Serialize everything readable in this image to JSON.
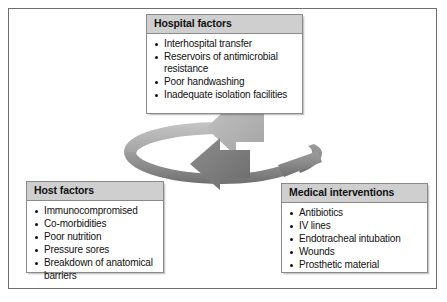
{
  "figure": {
    "frame_color": "#6f6f6f",
    "background": "#ffffff"
  },
  "cycle": {
    "name": "cycle-ring",
    "description": "Circular two-headed arrow linking the three factor groups",
    "ring_color_light": "#b9b9b9",
    "ring_color_dark": "#7d7d7d",
    "arrow_up_color": "#b0b0b0",
    "arrow_down_color": "#7a7a7a",
    "arrows": [
      {
        "name": "arrow-to-hospital",
        "direction": "up-left",
        "target": "Hospital factors"
      },
      {
        "name": "arrow-to-medical",
        "direction": "down-right",
        "target": "Medical interventions"
      }
    ]
  },
  "boxes": [
    {
      "id": "hospital",
      "title": "Hospital factors",
      "items": [
        "Interhospital transfer",
        "Reservoirs of antimicrobial resistance",
        "Poor handwashing",
        "Inadequate isolation facilities"
      ]
    },
    {
      "id": "host",
      "title": "Host factors",
      "items": [
        "Immunocompromised",
        "Co-morbidities",
        "Poor nutrition",
        "Pressure sores",
        "Breakdown of anatomical barriers"
      ]
    },
    {
      "id": "medical",
      "title": "Medical interventions",
      "items": [
        "Antibiotics",
        "IV lines",
        "Endotracheal intubation",
        "Wounds",
        "Prosthetic material"
      ]
    }
  ],
  "colors": {
    "header_fill": "#cfcfcf",
    "box_border": "#8a8a8a",
    "text": "#111111"
  }
}
